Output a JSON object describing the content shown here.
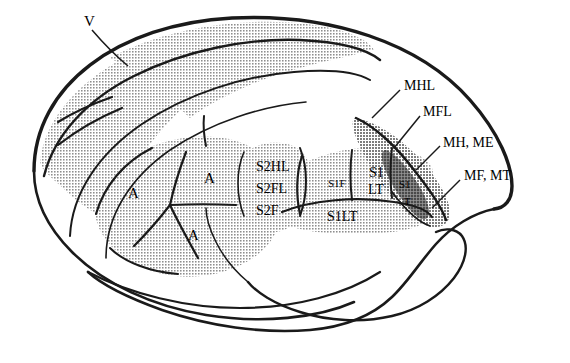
{
  "figure": {
    "kind": "rodent-brain-lateral-cortical-map",
    "colors": {
      "outline": "#1a1a1a",
      "background": "#ffffff",
      "shade_light": "#c9c9c9",
      "shade_mid": "#b0b0b0",
      "shade_dark": "#6e6e6e",
      "text": "#000000"
    }
  },
  "labels": {
    "visual": {
      "text": "V",
      "x": 84,
      "y": 14,
      "size": "big"
    },
    "auditory": [
      {
        "text": "A",
        "x": 128,
        "y": 186,
        "size": "big"
      },
      {
        "text": "A",
        "x": 204,
        "y": 171,
        "size": "big"
      },
      {
        "text": "A",
        "x": 188,
        "y": 228,
        "size": "big"
      }
    ],
    "somato_secondary": [
      {
        "text": "S2HL",
        "x": 256,
        "y": 160,
        "size": "mid"
      },
      {
        "text": "S2FL",
        "x": 256,
        "y": 182,
        "size": "mid"
      },
      {
        "text": "S2F",
        "x": 256,
        "y": 204,
        "size": "mid"
      }
    ],
    "somato_primary": [
      {
        "text": "S1F",
        "x": 328,
        "y": 178,
        "size": "sml"
      },
      {
        "text": "S1",
        "x": 369,
        "y": 166,
        "size": "mid"
      },
      {
        "text": "LT",
        "x": 368,
        "y": 183,
        "size": "mid"
      },
      {
        "text": "S1",
        "x": 399,
        "y": 179,
        "size": "sml"
      },
      {
        "text": "T",
        "x": 404,
        "y": 196,
        "size": "sml"
      },
      {
        "text": "S1LT",
        "x": 327,
        "y": 210,
        "size": "mid"
      }
    ],
    "motor": [
      {
        "text": "MHL",
        "x": 404,
        "y": 79,
        "size": "mid"
      },
      {
        "text": "MFL",
        "x": 423,
        "y": 105,
        "size": "mid"
      },
      {
        "text": "MH, ME",
        "x": 443,
        "y": 136,
        "size": "mid"
      },
      {
        "text": "MF, MT",
        "x": 464,
        "y": 169,
        "size": "mid"
      }
    ]
  },
  "legend_expansions": {
    "V": "visual cortex",
    "A": "auditory cortex",
    "S1": "primary somatosensory",
    "S2": "secondary somatosensory",
    "HL": "hindlimb",
    "FL": "forelimb",
    "F": "face",
    "LT": "lower trunk",
    "T": "trunk",
    "M": "motor",
    "H": "head",
    "E": "eye",
    "MT": "motor trunk"
  }
}
